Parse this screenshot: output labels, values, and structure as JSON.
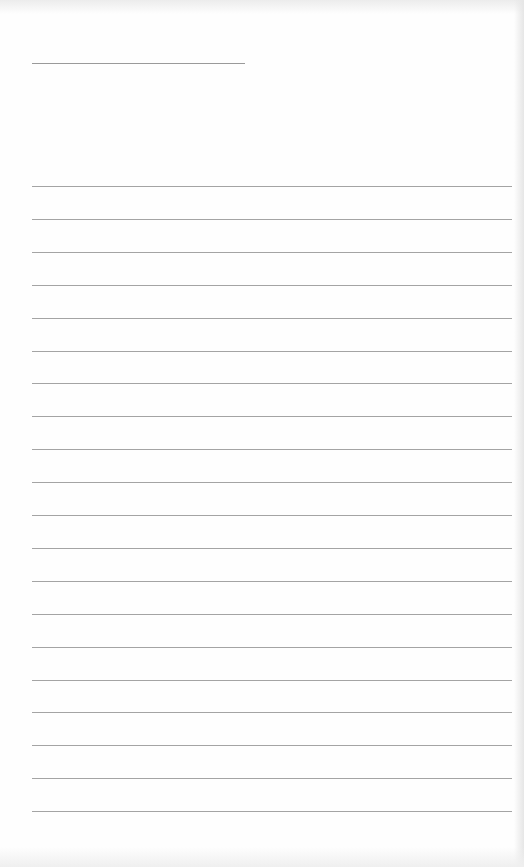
{
  "document": {
    "type": "blank lined sheet",
    "header_line": {
      "x": 32,
      "y": 63,
      "width": 213
    },
    "ruled_lines": {
      "count": 20,
      "first_y": 186,
      "spacing": 32.9,
      "x": 32,
      "width": 480
    },
    "colors": {
      "paper": "#fefefe",
      "line": "#a4a4a4"
    }
  }
}
